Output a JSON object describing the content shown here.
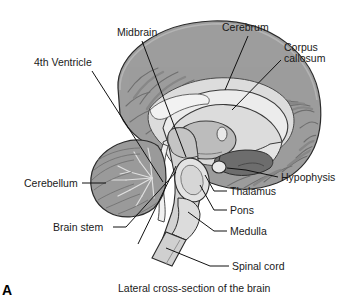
{
  "figure": {
    "panel_letter": "A",
    "caption": "Lateral cross-section of the brain",
    "colors": {
      "background": "#ffffff",
      "cortex_gray": "#9d9d9d",
      "cortex_dark": "#7e7e7e",
      "white_matter": "#dcdcdc",
      "light_structure": "#e4e4e4",
      "mid_structure": "#bcbcbc",
      "dark_structure": "#6d6d6d",
      "outline": "#2b2b2b",
      "leader_line": "#111111",
      "text": "#1a1a1a"
    }
  },
  "labels": [
    {
      "id": "midbrain",
      "text": "Midbrain",
      "x": 117,
      "y": 27
    },
    {
      "id": "cerebrum",
      "text": "Cerebrum",
      "x": 222,
      "y": 22
    },
    {
      "id": "corpus-line1",
      "text": "Corpus",
      "x": 284,
      "y": 42
    },
    {
      "id": "corpus-line2",
      "text": "callosum",
      "x": 284,
      "y": 53
    },
    {
      "id": "fourth-ventricle",
      "text": "4th Ventricle",
      "x": 34,
      "y": 57
    },
    {
      "id": "cerebellum",
      "text": "Cerebellum",
      "x": 24,
      "y": 178
    },
    {
      "id": "hypophysis",
      "text": "Hypophysis",
      "x": 281,
      "y": 172
    },
    {
      "id": "thalamus",
      "text": "Thalamus",
      "x": 230,
      "y": 186
    },
    {
      "id": "brain-stem",
      "text": "Brain stem",
      "x": 53,
      "y": 222
    },
    {
      "id": "pons",
      "text": "Pons",
      "x": 230,
      "y": 205
    },
    {
      "id": "medulla",
      "text": "Medulla",
      "x": 230,
      "y": 226
    },
    {
      "id": "spinal-cord",
      "text": "Spinal cord",
      "x": 232,
      "y": 261
    }
  ],
  "caption_position": {
    "x": 118,
    "y": 282
  },
  "panel_letter_position": {
    "x": 2,
    "y": 282
  },
  "anatomy_parts": [
    "cerebrum",
    "corpus callosum",
    "thalamus",
    "midbrain",
    "pons",
    "medulla",
    "cerebellum",
    "4th ventricle",
    "hypophysis",
    "brain stem",
    "spinal cord"
  ]
}
